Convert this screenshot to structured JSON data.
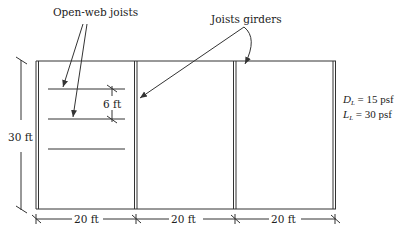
{
  "figure": {
    "labels": {
      "open_web_joists": "Open-web joists",
      "joists_girders": "Joists girders"
    },
    "dimensions": {
      "height": "30 ft",
      "joist_spacing": "6 ft",
      "bay_widths": [
        "20 ft",
        "20 ft",
        "20 ft"
      ]
    },
    "loads": {
      "dead": {
        "symbol": "D",
        "subscript": "L",
        "value": "= 15 psf"
      },
      "live": {
        "symbol": "L",
        "subscript": "L",
        "value": "= 30 psf"
      }
    },
    "colors": {
      "line": "#333333",
      "background": "#ffffff"
    }
  }
}
